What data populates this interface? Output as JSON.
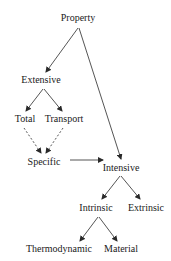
{
  "diagram": {
    "nodes": {
      "property": {
        "label": "Property",
        "x": 78,
        "y": 18
      },
      "extensive": {
        "label": "Extensive",
        "x": 41,
        "y": 80
      },
      "total": {
        "label": "Total",
        "x": 25,
        "y": 119
      },
      "transport": {
        "label": "Transport",
        "x": 64,
        "y": 119
      },
      "specific": {
        "label": "Specific",
        "x": 44,
        "y": 162
      },
      "intensive": {
        "label": "Intensive",
        "x": 121,
        "y": 168
      },
      "intrinsic": {
        "label": "Intrinsic",
        "x": 96,
        "y": 208
      },
      "extrinsic": {
        "label": "Extrinsic",
        "x": 146,
        "y": 208
      },
      "thermodynamic": {
        "label": "Thermodynamic",
        "x": 59,
        "y": 249
      },
      "material": {
        "label": "Material",
        "x": 121,
        "y": 249
      }
    },
    "edges": [
      {
        "from": "property",
        "to": "extensive",
        "style": "solid"
      },
      {
        "from": "property",
        "to": "intensive",
        "style": "solid"
      },
      {
        "from": "extensive",
        "to": "total",
        "style": "solid"
      },
      {
        "from": "extensive",
        "to": "transport",
        "style": "solid"
      },
      {
        "from": "total",
        "to": "specific",
        "style": "dashed"
      },
      {
        "from": "transport",
        "to": "specific",
        "style": "dashed"
      },
      {
        "from": "specific",
        "to": "intensive",
        "style": "solid"
      },
      {
        "from": "intensive",
        "to": "intrinsic",
        "style": "solid"
      },
      {
        "from": "intensive",
        "to": "extrinsic",
        "style": "solid"
      },
      {
        "from": "intrinsic",
        "to": "thermodynamic",
        "style": "solid"
      },
      {
        "from": "intrinsic",
        "to": "material",
        "style": "solid"
      }
    ],
    "line_color": "#2a2a2a"
  }
}
